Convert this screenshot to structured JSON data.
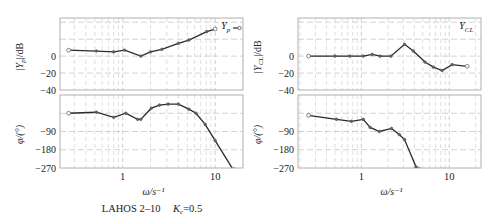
{
  "caption": {
    "main": "LAHOS 2–10",
    "gain_label": "K",
    "gain_sub": "c",
    "gain_value": "=0.5"
  },
  "style": {
    "frame_color": "#b0b0b0",
    "grid_color": "#c8c8c8",
    "line_color": "#2a2a2a",
    "marker_fill": "#ffffff"
  },
  "chart_data": [
    {
      "type": "line",
      "panel": "left-magnitude",
      "legend": "Y_p",
      "legend_text": "Y",
      "legend_sub": "p",
      "ylabel": "|Y_p|/dB",
      "ylabel_text": "|Y",
      "ylabel_sub": "p",
      "ylabel_suffix": "|/dB",
      "xscale": "log",
      "xlim": [
        0.21,
        20
      ],
      "ylim": [
        -40,
        45
      ],
      "yticks": [
        0,
        -20,
        -40
      ],
      "ygrid": [
        40,
        20,
        0,
        -20
      ],
      "x": [
        0.26,
        0.52,
        0.8,
        1.05,
        1.57,
        2.0,
        2.65,
        4.0,
        5.2,
        8.1,
        10.0
      ],
      "values": [
        7,
        6,
        5,
        7,
        0,
        5,
        8,
        15,
        19,
        29,
        32
      ]
    },
    {
      "type": "line",
      "panel": "left-phase",
      "ylabel": "φ/(°)",
      "xlabel": "ω/s⁻¹",
      "xscale": "log",
      "xlim": [
        0.21,
        20
      ],
      "ylim": [
        -270,
        90
      ],
      "yticks": [
        -90,
        -180,
        -270
      ],
      "ygrid": [
        0,
        -90,
        -180
      ],
      "xticks": [
        1,
        10
      ],
      "xtick_labels": [
        "1",
        "10"
      ],
      "x": [
        0.26,
        0.52,
        0.8,
        1.08,
        1.45,
        1.57,
        2.04,
        2.5,
        3.1,
        4.0,
        5.2,
        6.2,
        7.8,
        10.0,
        15.5
      ],
      "values": [
        0,
        5,
        -20,
        0,
        -30,
        -30,
        25,
        40,
        45,
        45,
        20,
        0,
        -55,
        -135,
        -275
      ]
    },
    {
      "type": "line",
      "panel": "right-magnitude",
      "legend": "Y_CL",
      "legend_text": "Y",
      "legend_sub": "CL",
      "ylabel": "|Y_CL|/dB",
      "ylabel_text": "|Y",
      "ylabel_sub": "CL",
      "ylabel_suffix": "|/dB",
      "xscale": "log",
      "xlim": [
        0.19,
        23
      ],
      "ylim": [
        -40,
        45
      ],
      "yticks": [
        0,
        -20,
        -40
      ],
      "ygrid": [
        40,
        20,
        0,
        -20
      ],
      "x": [
        0.25,
        0.5,
        0.74,
        1.05,
        1.33,
        1.63,
        2.17,
        3.1,
        3.9,
        5.3,
        6.6,
        8.3,
        10.8,
        16.0
      ],
      "values": [
        0,
        0,
        0,
        0,
        2,
        0,
        0,
        14,
        6,
        -7,
        -13,
        -17,
        -10,
        -12
      ]
    },
    {
      "type": "line",
      "panel": "right-phase",
      "ylabel": "φ/(°)",
      "xlabel": "ω/s⁻¹",
      "xscale": "log",
      "xlim": [
        0.19,
        23
      ],
      "ylim": [
        -270,
        90
      ],
      "yticks": [
        -90,
        -180,
        -270
      ],
      "ygrid": [
        0,
        -90,
        -180
      ],
      "xticks": [
        1,
        10
      ],
      "xtick_labels": [
        "1",
        "10"
      ],
      "x": [
        0.25,
        0.52,
        0.77,
        1.05,
        1.26,
        1.6,
        2.2,
        2.7,
        3.1,
        4.2,
        4.5
      ],
      "values": [
        -10,
        -30,
        -40,
        -30,
        -70,
        -90,
        -75,
        -105,
        -130,
        -265,
        -275
      ]
    }
  ],
  "layout": {
    "panels": [
      {
        "x0": 60,
        "x1": 243,
        "mag_y0": 18,
        "mag_y1": 90,
        "ph_y0": 95,
        "ph_y1": 168
      },
      {
        "x0": 298,
        "x1": 481,
        "mag_y0": 18,
        "mag_y1": 90,
        "ph_y0": 95,
        "ph_y1": 168
      }
    ]
  }
}
